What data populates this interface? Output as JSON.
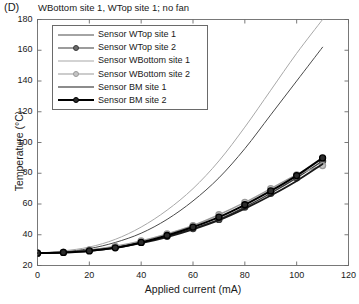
{
  "panel": {
    "letter": "(D)",
    "title": "WBottom site 1, WTop site 1; no fan"
  },
  "chart_data": {
    "type": "line",
    "title": "WBottom site 1, WTop site 1; no fan",
    "xlabel": "Applied current (mA)",
    "ylabel": "Temperature (°C)",
    "xlim": [
      0,
      120
    ],
    "ylim": [
      20,
      180
    ],
    "xticks": [
      0,
      20,
      40,
      60,
      80,
      100,
      120
    ],
    "yticks": [
      20,
      40,
      60,
      80,
      100,
      120,
      140,
      160,
      180
    ],
    "grid": false,
    "legend_position": "upper-left-inside",
    "x": [
      0,
      10,
      20,
      30,
      40,
      50,
      60,
      70,
      80,
      90,
      100,
      110
    ],
    "series": [
      {
        "name": "Sensor WTop site 1",
        "color": "#4a4a4a",
        "line_width": 1.0,
        "marker": "none",
        "smooth": true,
        "values": [
          28,
          29,
          31,
          35,
          41,
          50,
          62,
          77,
          96,
          118,
          140,
          162
        ]
      },
      {
        "name": "Sensor WTop site 2",
        "color": "#3a3a3a",
        "line_width": 1.4,
        "marker": "circle",
        "marker_fill": "#6b6b6b",
        "smooth": false,
        "values": [
          28,
          28.5,
          30,
          32,
          35,
          39,
          44,
          50,
          58,
          67,
          77,
          88
        ]
      },
      {
        "name": "Sensor WBottom site 1",
        "color": "#a8a8a8",
        "line_width": 1.0,
        "marker": "none",
        "smooth": true,
        "values": [
          28,
          29.5,
          32,
          37,
          45,
          56,
          70,
          88,
          110,
          134,
          158,
          180
        ]
      },
      {
        "name": "Sensor WBottom site 2",
        "color": "#9a9a9a",
        "line_width": 1.4,
        "marker": "circle",
        "marker_fill": "#c4c4c4",
        "smooth": false,
        "values": [
          28,
          28.5,
          30,
          32.5,
          36,
          40.5,
          46,
          53,
          61,
          70,
          79,
          85
        ]
      },
      {
        "name": "Sensor BM site 1",
        "color": "#1a1a1a",
        "line_width": 1.8,
        "marker": "none",
        "smooth": true,
        "values": [
          28,
          28.5,
          29.5,
          31.5,
          34.5,
          38.5,
          43.5,
          49.5,
          57,
          65.5,
          75,
          86
        ]
      },
      {
        "name": "Sensor BM site 2",
        "color": "#000000",
        "line_width": 2.0,
        "marker": "circle",
        "marker_fill": "#2b2b2b",
        "smooth": false,
        "values": [
          28,
          28.5,
          29.5,
          31.5,
          35,
          39.5,
          45,
          51.5,
          59.5,
          68.5,
          78.5,
          90
        ]
      }
    ]
  },
  "axes": {
    "xticklabels": [
      "0",
      "20",
      "40",
      "60",
      "80",
      "100",
      "120"
    ],
    "yticklabels": [
      "20",
      "40",
      "60",
      "80",
      "100",
      "120",
      "140",
      "160",
      "180"
    ]
  }
}
